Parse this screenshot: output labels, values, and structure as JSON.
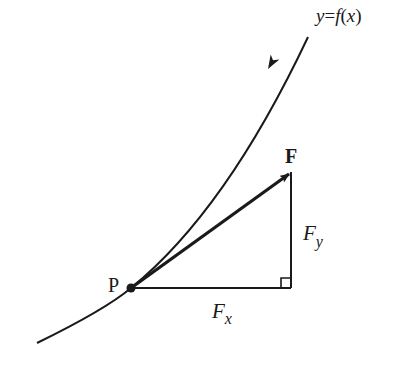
{
  "diagram": {
    "curve_label": {
      "y": "y",
      "eq": "=",
      "f": "f",
      "paren_open": "(",
      "x": "x",
      "paren_close": ")"
    },
    "point_label": "P",
    "force_label": "F",
    "fx_label": {
      "main": "F",
      "sub": "x"
    },
    "fy_label": {
      "main": "F",
      "sub": "y"
    },
    "colors": {
      "stroke": "#1a1a1a",
      "background": "#ffffff"
    }
  }
}
